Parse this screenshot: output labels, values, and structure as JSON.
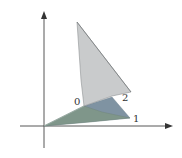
{
  "diagram": {
    "type": "3d-surface-sketch",
    "axes": {
      "origin": [
        44,
        126
      ],
      "x_axis": {
        "from": [
          20,
          126
        ],
        "to": [
          173,
          126
        ]
      },
      "y_axis": {
        "from": [
          44,
          148
        ],
        "to": [
          44,
          11
        ]
      }
    },
    "points": {
      "origin": [
        44,
        126
      ],
      "p0": [
        84,
        106
      ],
      "p1": [
        130,
        118
      ],
      "p2": [
        131,
        92
      ],
      "top": [
        77,
        22
      ]
    },
    "labels": [
      {
        "text": "0",
        "x": 66,
        "y": 97
      },
      {
        "text": "2",
        "x": 122,
        "y": 93
      },
      {
        "text": "1",
        "x": 133,
        "y": 114
      }
    ],
    "colors": {
      "gray_face": "#c9cbcc",
      "blue_face": "#7f93a2",
      "green_face": "#7f968a",
      "axis": "#444444",
      "edge": "#666666"
    }
  }
}
